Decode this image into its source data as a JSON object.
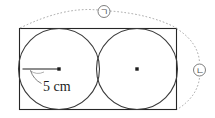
{
  "figure": {
    "canvas": {
      "width": 215,
      "height": 118,
      "background": "#ffffff"
    },
    "colors": {
      "outline": "#262626",
      "circle_stroke": "#3a3a3a",
      "dotted": "#9a9a9a",
      "radius_line": "#8d8d8d",
      "text": "#1c1c1c",
      "label_text": "#4a4a4a",
      "center_dot": "#1c1c1c"
    },
    "rectangle": {
      "x": 19.5,
      "y": 28.5,
      "width": 157,
      "height": 81,
      "stroke_width": 1.1
    },
    "circles": [
      {
        "name": "left-circle",
        "cx": 59,
        "cy": 69,
        "r": 40.5,
        "stroke_width": 1.1
      },
      {
        "name": "right-circle",
        "cx": 137,
        "cy": 69,
        "r": 40.5,
        "stroke_width": 1.1
      }
    ],
    "center_dots": [
      {
        "name": "left-circle-center-dot",
        "cx": 59,
        "cy": 69,
        "size": 3.4
      },
      {
        "name": "right-circle-center-dot",
        "cx": 137,
        "cy": 69,
        "size": 3.4
      }
    ],
    "radius_segment": {
      "name": "radius-line",
      "x1": 22.5,
      "y1": 69,
      "x2": 59,
      "y2": 69,
      "stroke_width": 2.1
    },
    "radius_leader": {
      "name": "radius-leader-line",
      "path": "M 30.5 70.5 Q 33.5 79.5 41.5 83.5",
      "arc_path": "M 30.0 70.5 Q 36.5 75.5 44.0 72.0",
      "stroke_width": 0.8
    },
    "measure_label": {
      "text": "5 cm",
      "x": 43,
      "y": 91,
      "font_size": 14
    },
    "dotted_arcs": [
      {
        "name": "top-span-arc",
        "path": "M 20.0 28.0 Q 64.0 6.5 98.0 10.0",
        "stroke_width": 0.9,
        "dash": "1.6 2.0"
      },
      {
        "name": "top-span-arc-right",
        "path": "M 110.0 11.0 Q 150.0 14.0 176.5 28.0",
        "stroke_width": 0.9,
        "dash": "1.6 2.0"
      },
      {
        "name": "right-span-arc-upper",
        "path": "M 176.5 28.5 Q 198.0 42.0 199.5 62.0",
        "stroke_width": 0.9,
        "dash": "1.6 2.0"
      },
      {
        "name": "right-span-arc-lower",
        "path": "M 199.5 78.0 Q 197.0 97.0 177.0 109.5",
        "stroke_width": 0.9,
        "dash": "1.6 2.0"
      }
    ],
    "callout_labels": [
      {
        "name": "callout-label-top",
        "text": "ㄱ",
        "cx": 104,
        "cy": 11.5,
        "r": 6.0,
        "stroke_width": 0.9,
        "font_size": 9
      },
      {
        "name": "callout-label-right",
        "text": "ㄴ",
        "cx": 199.5,
        "cy": 70,
        "r": 6.0,
        "stroke_width": 0.9,
        "font_size": 9
      }
    ]
  }
}
